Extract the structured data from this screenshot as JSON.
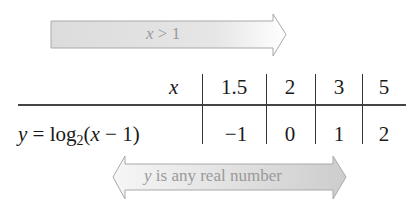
{
  "top_arrow": {
    "direction": "right",
    "label_var": "x",
    "label_rest": " > 1",
    "fill_color": "#e2e2e2",
    "stroke_color": "#a8a8a8"
  },
  "table": {
    "row_headers": {
      "x_var": "x",
      "y_var": "y",
      "y_eq": " = log",
      "y_sub": "2",
      "y_paren_open": "(",
      "y_inner_var": "x",
      "y_inner_rest": " − 1)"
    },
    "x_values": [
      "1.5",
      "2",
      "3",
      "5"
    ],
    "y_values": [
      "−1",
      "0",
      "1",
      "2"
    ]
  },
  "bottom_arrow": {
    "direction": "both",
    "label_var": "y",
    "label_rest": " is any real number",
    "gradient_start": "#f4f4f4",
    "gradient_end": "#cfcfcf",
    "stroke_color": "#a8a8a8"
  }
}
